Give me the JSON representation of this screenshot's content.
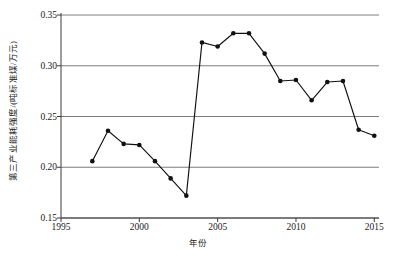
{
  "chart_data": {
    "type": "line",
    "title": "",
    "xlabel": "年份",
    "ylabel": "第三产业能耗强度/(吨标准煤/万元)",
    "xlim": [
      1995,
      2015.3
    ],
    "ylim": [
      0.15,
      0.352
    ],
    "grid": true,
    "legend": null,
    "x": [
      1997,
      1998,
      1999,
      2000,
      2001,
      2002,
      2003,
      2004,
      2005,
      2006,
      2007,
      2008,
      2009,
      2010,
      2011,
      2012,
      2013,
      2014,
      2015
    ],
    "values": [
      0.206,
      0.236,
      0.223,
      0.222,
      0.206,
      0.189,
      0.172,
      0.323,
      0.319,
      0.332,
      0.332,
      0.312,
      0.285,
      0.286,
      0.266,
      0.284,
      0.285,
      0.237,
      0.231
    ],
    "series": [
      {
        "name": "第三产业能耗强度",
        "values": [
          0.206,
          0.236,
          0.223,
          0.222,
          0.206,
          0.189,
          0.172,
          0.323,
          0.319,
          0.332,
          0.332,
          0.312,
          0.285,
          0.286,
          0.266,
          0.284,
          0.285,
          0.237,
          0.231
        ]
      }
    ],
    "x_ticks": [
      {
        "value": 1995,
        "label": "1995"
      },
      {
        "value": 2000,
        "label": "2000"
      },
      {
        "value": 2005,
        "label": "2005"
      },
      {
        "value": 2010,
        "label": "2010"
      },
      {
        "value": 2015,
        "label": "2015"
      }
    ],
    "y_ticks": [
      {
        "value": 0.15,
        "label": "0.15"
      },
      {
        "value": 0.2,
        "label": "0.20"
      },
      {
        "value": 0.25,
        "label": "0.25"
      },
      {
        "value": 0.3,
        "label": "0.30"
      },
      {
        "value": 0.35,
        "label": "0.35"
      }
    ],
    "colors": {
      "line": "#111111",
      "marker": "#111111",
      "gridline": "#6e6e6e",
      "axis": "#3a3a3a",
      "background": "#ffffff"
    }
  }
}
